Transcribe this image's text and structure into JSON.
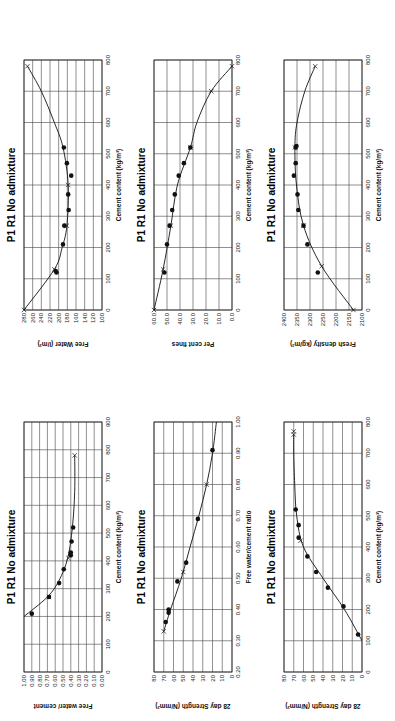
{
  "page": {
    "orientation": "rotated-90"
  },
  "chart_data": [
    {
      "id": "free-water",
      "type": "scatter",
      "title": "P1 R1 No admixture",
      "xlabel": "Cement content (kg/m³)",
      "ylabel": "Free Water (l/m³)",
      "xlim": [
        0,
        800
      ],
      "ylim": [
        100,
        280
      ],
      "xticks": [
        "0",
        "100",
        "200",
        "300",
        "400",
        "500",
        "600",
        "700",
        "800"
      ],
      "yticks": [
        "100",
        "120",
        "140",
        "160",
        "180",
        "200",
        "220",
        "240",
        "260",
        "280"
      ],
      "grid": true,
      "points": [
        [
          120,
          205
        ],
        [
          125,
          207
        ],
        [
          210,
          190
        ],
        [
          270,
          187
        ],
        [
          320,
          177
        ],
        [
          370,
          178
        ],
        [
          430,
          171
        ],
        [
          470,
          181
        ],
        [
          520,
          188
        ]
      ],
      "curve": [
        [
          0,
          280
        ],
        [
          130,
          210
        ],
        [
          200,
          192
        ],
        [
          270,
          181
        ],
        [
          400,
          178
        ],
        [
          520,
          190
        ],
        [
          600,
          210
        ],
        [
          700,
          240
        ],
        [
          780,
          272
        ]
      ],
      "crosses": [
        [
          0,
          280
        ],
        [
          130,
          210
        ],
        [
          270,
          181
        ],
        [
          400,
          178
        ],
        [
          780,
          272
        ]
      ]
    },
    {
      "id": "per-cent-fines",
      "type": "scatter",
      "title": "P1 R1 No admixture",
      "xlabel": "Cement content (kg/m³)",
      "ylabel": "Per cent fines",
      "xlim": [
        0,
        800
      ],
      "ylim": [
        0,
        60
      ],
      "xticks": [
        "0",
        "100",
        "200",
        "300",
        "400",
        "500",
        "600",
        "700",
        "800"
      ],
      "yticks": [
        "0.0",
        "10.0",
        "20.0",
        "30.0",
        "40.0",
        "50.0",
        "60.0"
      ],
      "grid": true,
      "points": [
        [
          120,
          52
        ],
        [
          210,
          50
        ],
        [
          270,
          48
        ],
        [
          320,
          46
        ],
        [
          370,
          44
        ],
        [
          430,
          41
        ],
        [
          470,
          37
        ],
        [
          520,
          32
        ]
      ],
      "curve": [
        [
          0,
          60
        ],
        [
          130,
          53
        ],
        [
          270,
          47
        ],
        [
          400,
          42
        ],
        [
          520,
          32
        ],
        [
          600,
          27
        ],
        [
          700,
          16
        ],
        [
          780,
          0
        ]
      ],
      "crosses": [
        [
          0,
          60
        ],
        [
          130,
          53
        ],
        [
          270,
          47
        ],
        [
          520,
          32
        ],
        [
          700,
          16
        ],
        [
          780,
          0
        ]
      ]
    },
    {
      "id": "fresh-density",
      "type": "scatter",
      "title": "P1 R1 No admixture",
      "xlabel": "Cement content (kg/m³)",
      "ylabel": "Fresh density (kg/m³)",
      "xlim": [
        0,
        800
      ],
      "ylim": [
        2100,
        2400
      ],
      "xticks": [
        "0",
        "100",
        "200",
        "300",
        "400",
        "500",
        "600",
        "700",
        "800"
      ],
      "yticks": [
        "2100",
        "2150",
        "2200",
        "2250",
        "2300",
        "2350",
        "2400"
      ],
      "grid": true,
      "points": [
        [
          120,
          2270
        ],
        [
          210,
          2310
        ],
        [
          270,
          2325
        ],
        [
          320,
          2345
        ],
        [
          370,
          2348
        ],
        [
          430,
          2362
        ],
        [
          470,
          2355
        ],
        [
          520,
          2355
        ],
        [
          525,
          2352
        ]
      ],
      "curve": [
        [
          0,
          2133
        ],
        [
          140,
          2255
        ],
        [
          270,
          2325
        ],
        [
          400,
          2352
        ],
        [
          520,
          2358
        ],
        [
          600,
          2350
        ],
        [
          700,
          2320
        ],
        [
          780,
          2280
        ]
      ],
      "crosses": [
        [
          0,
          2133
        ],
        [
          140,
          2255
        ],
        [
          270,
          2325
        ],
        [
          520,
          2358
        ],
        [
          780,
          2280
        ]
      ]
    },
    {
      "id": "water-cement-ratio",
      "type": "scatter",
      "title": "P1 R1 No admixture",
      "xlabel": "Cement content (kg/m³)",
      "ylabel": "Free water/ cement",
      "xlim": [
        0,
        900
      ],
      "ylim": [
        0,
        1
      ],
      "xticks": [
        "0",
        "100",
        "200",
        "300",
        "400",
        "500",
        "600",
        "700",
        "800",
        "900"
      ],
      "yticks": [
        "0.00",
        "0.10",
        "0.20",
        "0.30",
        "0.40",
        "0.50",
        "0.60",
        "0.70",
        "0.80",
        "0.90",
        "1.00"
      ],
      "grid": true,
      "points": [
        [
          210,
          0.9
        ],
        [
          270,
          0.68
        ],
        [
          320,
          0.55
        ],
        [
          370,
          0.49
        ],
        [
          420,
          0.4
        ],
        [
          430,
          0.4
        ],
        [
          470,
          0.39
        ],
        [
          520,
          0.37
        ]
      ],
      "curve": [
        [
          200,
          1.0
        ],
        [
          270,
          0.7
        ],
        [
          330,
          0.55
        ],
        [
          410,
          0.44
        ],
        [
          520,
          0.38
        ],
        [
          650,
          0.35
        ],
        [
          780,
          0.35
        ]
      ],
      "crosses": [
        [
          270,
          0.68
        ],
        [
          410,
          0.43
        ],
        [
          780,
          0.35
        ]
      ]
    },
    {
      "id": "strength-vs-wc",
      "type": "scatter",
      "title": "P1 R1 No admixture",
      "xlabel": "Free water/cement ratio",
      "ylabel": "28 day Strength (N/mm²)",
      "xlim": [
        0.2,
        1.0
      ],
      "ylim": [
        0,
        80
      ],
      "xticks": [
        "0.20",
        "0.30",
        "0.40",
        "0.50",
        "0.60",
        "0.70",
        "0.80",
        "0.90",
        "1.00"
      ],
      "yticks": [
        "0",
        "10",
        "20",
        "30",
        "40",
        "50",
        "60",
        "70",
        "80"
      ],
      "grid": true,
      "points": [
        [
          0.36,
          68
        ],
        [
          0.39,
          65
        ],
        [
          0.4,
          65
        ],
        [
          0.49,
          56
        ],
        [
          0.55,
          47
        ],
        [
          0.69,
          35
        ],
        [
          0.91,
          20
        ]
      ],
      "curve": [
        [
          0.33,
          70
        ],
        [
          0.4,
          63
        ],
        [
          0.5,
          52
        ],
        [
          0.6,
          43
        ],
        [
          0.7,
          34
        ],
        [
          0.8,
          26
        ],
        [
          0.9,
          20
        ],
        [
          1.0,
          16
        ]
      ],
      "crosses": [
        [
          0.33,
          70
        ],
        [
          0.52,
          50
        ],
        [
          0.8,
          26
        ]
      ]
    },
    {
      "id": "strength-vs-cement",
      "type": "scatter",
      "title": "P1 R1 No admixture",
      "xlabel": "Cement content (kg/m³)",
      "ylabel": "28 day Strength (N/mm²)",
      "xlim": [
        0,
        800
      ],
      "ylim": [
        0,
        80
      ],
      "xticks": [
        "0",
        "100",
        "200",
        "300",
        "400",
        "500",
        "600",
        "700",
        "800"
      ],
      "yticks": [
        "0",
        "10",
        "20",
        "30",
        "40",
        "50",
        "60",
        "70",
        "80"
      ],
      "grid": true,
      "points": [
        [
          120,
          4
        ],
        [
          210,
          19
        ],
        [
          270,
          35
        ],
        [
          320,
          47
        ],
        [
          370,
          56
        ],
        [
          430,
          65
        ],
        [
          470,
          65
        ],
        [
          520,
          68
        ]
      ],
      "curve": [
        [
          100,
          0
        ],
        [
          200,
          18
        ],
        [
          300,
          40
        ],
        [
          400,
          60
        ],
        [
          500,
          67
        ],
        [
          600,
          69
        ],
        [
          700,
          70
        ],
        [
          760,
          70
        ]
      ],
      "crosses": [
        [
          420,
          63
        ],
        [
          760,
          70
        ],
        [
          770,
          70
        ]
      ]
    }
  ]
}
